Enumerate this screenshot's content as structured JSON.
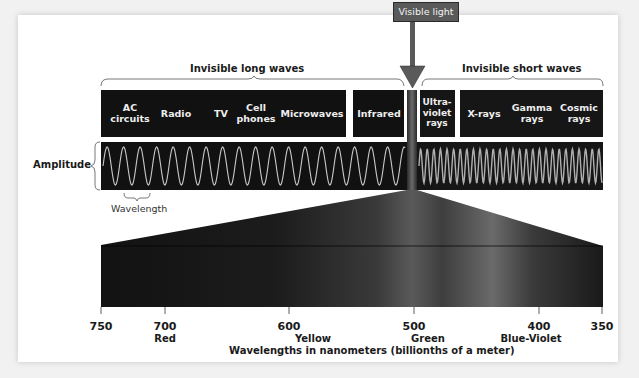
{
  "visible_label": "Visible light",
  "groups": {
    "long": "Invisible long waves",
    "short": "Invisible short waves"
  },
  "bands": {
    "ac": [
      "AC",
      "circuits"
    ],
    "radio": "Radio",
    "tv": "TV",
    "cell": [
      "Cell",
      "phones"
    ],
    "microwaves": "Microwaves",
    "infrared": "Infrared",
    "uv": [
      "Ultra-",
      "violet",
      "rays"
    ],
    "xrays": "X-rays",
    "gamma": [
      "Gamma",
      "rays"
    ],
    "cosmic": [
      "Cosmic",
      "rays"
    ]
  },
  "amplitude_label": "Amplitude",
  "wavelength_label": "Wavelength",
  "axis": {
    "ticks": [
      "750",
      "700",
      "600",
      "500",
      "400",
      "350"
    ],
    "colors": {
      "red": "Red",
      "yellow": "Yellow",
      "green": "Green",
      "blue_violet": "Blue-Violet"
    },
    "title": "Wavelengths in nanometers (billionths of a meter)"
  },
  "colors": {
    "box_fill": "#111111",
    "wave_stroke": "#bdbdbd",
    "arrow": "#5a5a5a",
    "card": "#ffffff",
    "page": "#f1f1f1"
  }
}
